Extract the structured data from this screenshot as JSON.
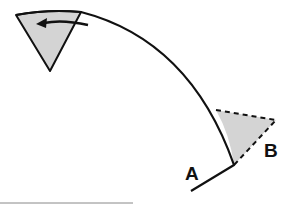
{
  "diagram": {
    "labels": {
      "a": "A",
      "b": "B"
    },
    "colors": {
      "stroke": "#111111",
      "fill": "#d4d4d4",
      "rule": "#888888"
    },
    "elements": [
      "curved arc from top-left to lower-right with kink",
      "shaded triangle at top-left with leftward arrow",
      "shaded triangle at lower-right with dashed edges labeled B",
      "label A at arc end"
    ]
  }
}
